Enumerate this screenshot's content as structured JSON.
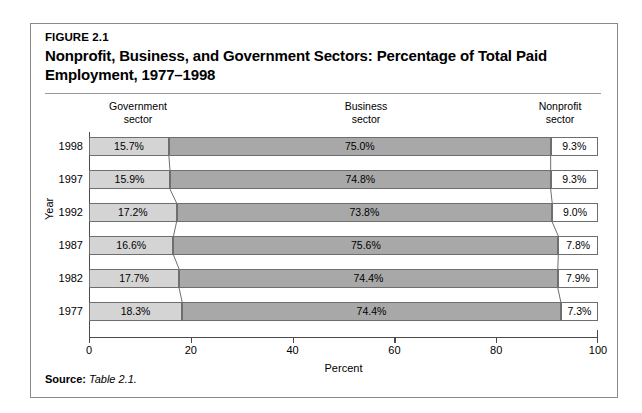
{
  "figure": {
    "label": "FIGURE 2.1",
    "title": "Nonprofit, Business, and Government Sectors: Percentage of Total Paid Employment, 1977–1998",
    "source_label": "Source:",
    "source_value": "Table 2.1."
  },
  "headers": {
    "government": {
      "line1": "Government",
      "line2": "sector"
    },
    "business": {
      "line1": "Business",
      "line2": "sector"
    },
    "nonprofit": {
      "line1": "Nonprofit",
      "line2": "sector"
    }
  },
  "chart_data": {
    "type": "bar",
    "orientation": "horizontal",
    "stacked": true,
    "title": "Nonprofit, Business, and Government Sectors: Percentage of Total Paid Employment, 1977–1998",
    "xlabel": "Percent",
    "ylabel": "Year",
    "xlim": [
      0,
      100
    ],
    "xticks": [
      0,
      20,
      40,
      60,
      80,
      100
    ],
    "xtick_labels": [
      "0",
      "20",
      "40",
      "60",
      "80",
      "100"
    ],
    "grid": false,
    "legend_position": "top-column-headers",
    "categories": [
      "1998",
      "1997",
      "1992",
      "1987",
      "1982",
      "1977"
    ],
    "series": [
      {
        "name": "Government sector",
        "color": "#d4d4d4",
        "values": [
          15.7,
          15.9,
          17.2,
          16.6,
          17.7,
          18.3
        ],
        "labels": [
          "15.7%",
          "15.9%",
          "17.2%",
          "16.6%",
          "17.7%",
          "18.3%"
        ]
      },
      {
        "name": "Business sector",
        "color": "#a8a8a8",
        "values": [
          75.0,
          74.8,
          73.8,
          75.6,
          74.4,
          74.4
        ],
        "labels": [
          "75.0%",
          "74.8%",
          "73.8%",
          "75.6%",
          "74.4%",
          "74.4%"
        ]
      },
      {
        "name": "Nonprofit sector",
        "color": "#ffffff",
        "values": [
          9.3,
          9.3,
          9.0,
          7.8,
          7.9,
          7.3
        ],
        "labels": [
          "9.3%",
          "9.3%",
          "9.0%",
          "7.8%",
          "7.9%",
          "7.3%"
        ]
      }
    ]
  }
}
